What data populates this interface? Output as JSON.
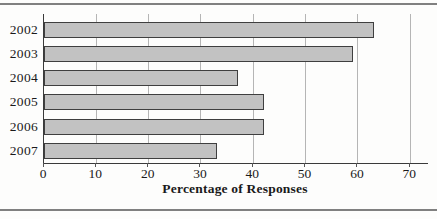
{
  "chart_data": {
    "type": "bar",
    "orientation": "horizontal",
    "categories": [
      "2002",
      "2003",
      "2004",
      "2005",
      "2006",
      "2007"
    ],
    "values": [
      63,
      59,
      37,
      42,
      42,
      33
    ],
    "title": "",
    "xlabel": "Percentage of Responses",
    "ylabel": "",
    "xticks": [
      0,
      10,
      20,
      30,
      40,
      50,
      60,
      70
    ],
    "xtick_labels": [
      "0",
      "10",
      "20",
      "30",
      "40",
      "50",
      "60",
      "70"
    ],
    "xlim": [
      0,
      73.4
    ],
    "grid": "vertical-on",
    "legend": "none",
    "colors": {
      "bar_fill": "#c2c2c2",
      "bar_border": "#3f3f3f",
      "gridline": "#b5b5b5",
      "axis": "#3a3a3a",
      "tick": "#555555",
      "text": "#1a1a1a",
      "rule": "#808080",
      "background": "#fdfdfc"
    }
  }
}
